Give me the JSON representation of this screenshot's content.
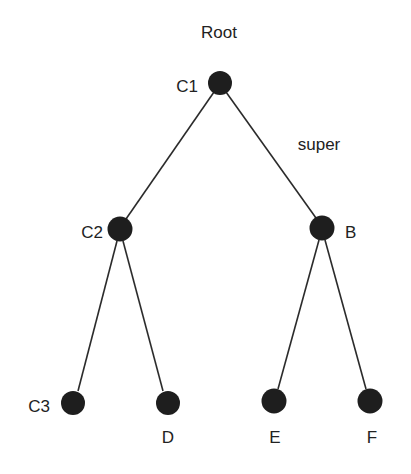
{
  "diagram": {
    "type": "tree",
    "title": "Root",
    "edge_label": "super",
    "nodes": [
      {
        "id": "C1",
        "label": "C1",
        "x": 220,
        "y": 83
      },
      {
        "id": "C2",
        "label": "C2",
        "x": 120,
        "y": 229
      },
      {
        "id": "B",
        "label": "B",
        "x": 322,
        "y": 228
      },
      {
        "id": "C3",
        "label": "C3",
        "x": 73,
        "y": 403
      },
      {
        "id": "D",
        "label": "D",
        "x": 168,
        "y": 403
      },
      {
        "id": "E",
        "label": "E",
        "x": 274,
        "y": 401
      },
      {
        "id": "F",
        "label": "F",
        "x": 370,
        "y": 401
      }
    ],
    "edges": [
      {
        "from": "C1",
        "to": "C2"
      },
      {
        "from": "C1",
        "to": "B",
        "label": "super"
      },
      {
        "from": "C2",
        "to": "C3"
      },
      {
        "from": "C2",
        "to": "D"
      },
      {
        "from": "B",
        "to": "E"
      },
      {
        "from": "B",
        "to": "F"
      }
    ],
    "colors": {
      "node": "#1e1e1e",
      "edge": "#2b2b2b",
      "text": "#222222",
      "background": "#ffffff"
    }
  }
}
